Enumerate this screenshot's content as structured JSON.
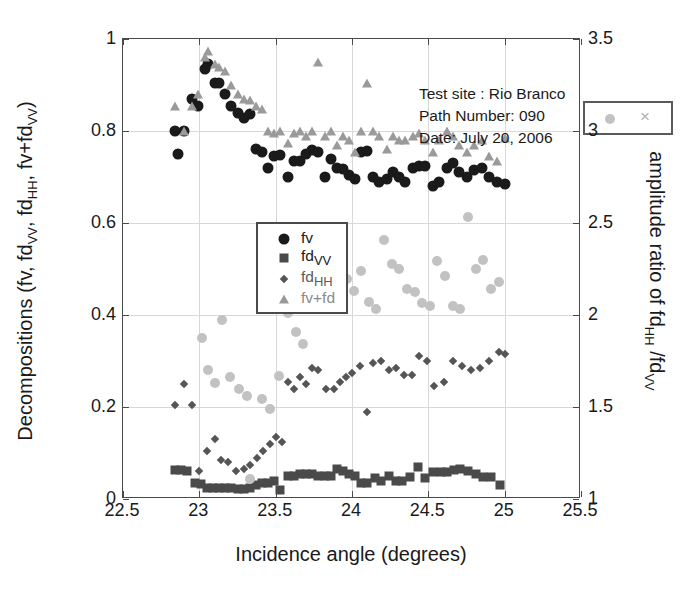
{
  "chart_data": {
    "type": "scatter",
    "title": "",
    "xlabel": "Incidence angle (degrees)",
    "ylabel": "Decompositions (fv, fd_VV, fd_HH, fv+fd_VV)",
    "ylabel_right": "amplitude ratio of fd_HH /fd_VV",
    "xlim": [
      22.5,
      25.5
    ],
    "ylim": [
      0,
      1
    ],
    "ylim_right": [
      1,
      3.5
    ],
    "xticks": [
      "22.5",
      "23",
      "23.5",
      "24",
      "24.5",
      "25",
      "25.5"
    ],
    "xtick_values": [
      22.5,
      23,
      23.5,
      24,
      24.5,
      25,
      25.5
    ],
    "yticks_left": [
      "0",
      "0.2",
      "0.4",
      "0.6",
      "0.8",
      "1"
    ],
    "ytick_values_left": [
      0,
      0.2,
      0.4,
      0.6,
      0.8,
      1
    ],
    "yticks_right": [
      "1",
      "1.5",
      "2",
      "2.5",
      "3",
      "3.5"
    ],
    "ytick_values_right": [
      1,
      1.5,
      2,
      2.5,
      3,
      3.5
    ],
    "grid": true,
    "legend_position": "center-left",
    "annotation": {
      "test_site": "Test site : Rio Branco",
      "path_number": "Path Number: 090",
      "date": "Date: July 20, 2006"
    },
    "legend_entries": [
      {
        "label": "fv",
        "marker": "circle",
        "color": "#1a1a1a",
        "axis": "left"
      },
      {
        "label": "fd_VV",
        "marker": "square",
        "color": "#4a4a4a",
        "axis": "left"
      },
      {
        "label": "fd_HH",
        "marker": "diamond",
        "color": "#555555",
        "axis": "left"
      },
      {
        "label": "fv+fd",
        "marker": "triangle",
        "color": "#9a9a9a",
        "axis": "left"
      }
    ],
    "legend_ratio": [
      {
        "label": "",
        "marker": "circle",
        "color": "#c2c2c2",
        "axis": "right"
      },
      {
        "label": "",
        "marker": "x",
        "color": "#b0b0b0",
        "axis": "right"
      }
    ],
    "series": [
      {
        "name": "fv",
        "marker": "circle",
        "color": "#1a1a1a",
        "axis": "left",
        "points": [
          [
            22.84,
            0.8
          ],
          [
            22.86,
            0.75
          ],
          [
            22.9,
            0.8
          ],
          [
            22.95,
            0.87
          ],
          [
            22.99,
            0.855
          ],
          [
            23.04,
            0.935
          ],
          [
            23.06,
            0.945
          ],
          [
            23.1,
            0.905
          ],
          [
            23.13,
            0.905
          ],
          [
            23.17,
            0.88
          ],
          [
            23.21,
            0.855
          ],
          [
            23.25,
            0.84
          ],
          [
            23.29,
            0.828
          ],
          [
            23.33,
            0.838
          ],
          [
            23.37,
            0.76
          ],
          [
            23.41,
            0.755
          ],
          [
            23.45,
            0.72
          ],
          [
            23.49,
            0.745
          ],
          [
            23.53,
            0.748
          ],
          [
            23.58,
            0.7
          ],
          [
            23.62,
            0.735
          ],
          [
            23.66,
            0.735
          ],
          [
            23.7,
            0.75
          ],
          [
            23.74,
            0.758
          ],
          [
            23.78,
            0.755
          ],
          [
            23.82,
            0.7
          ],
          [
            23.86,
            0.74
          ],
          [
            23.9,
            0.72
          ],
          [
            23.94,
            0.718
          ],
          [
            23.98,
            0.705
          ],
          [
            24.02,
            0.695
          ],
          [
            24.06,
            0.755
          ],
          [
            24.1,
            0.757
          ],
          [
            24.14,
            0.7
          ],
          [
            24.18,
            0.69
          ],
          [
            24.23,
            0.695
          ],
          [
            24.27,
            0.71
          ],
          [
            24.31,
            0.7
          ],
          [
            24.35,
            0.69
          ],
          [
            24.4,
            0.72
          ],
          [
            24.44,
            0.725
          ],
          [
            24.48,
            0.725
          ],
          [
            24.53,
            0.68
          ],
          [
            24.57,
            0.69
          ],
          [
            24.62,
            0.72
          ],
          [
            24.66,
            0.73
          ],
          [
            24.7,
            0.71
          ],
          [
            24.75,
            0.7
          ],
          [
            24.8,
            0.715
          ],
          [
            24.85,
            0.72
          ],
          [
            24.9,
            0.7
          ],
          [
            24.95,
            0.69
          ],
          [
            25.0,
            0.685
          ]
        ]
      },
      {
        "name": "fv+fd",
        "marker": "triangle",
        "color": "#9a9a9a",
        "axis": "left",
        "points": [
          [
            22.84,
            0.855
          ],
          [
            22.9,
            0.8
          ],
          [
            22.95,
            0.855
          ],
          [
            22.99,
            0.88
          ],
          [
            23.04,
            0.96
          ],
          [
            23.06,
            0.975
          ],
          [
            23.1,
            0.945
          ],
          [
            23.13,
            0.94
          ],
          [
            23.17,
            0.93
          ],
          [
            23.21,
            0.9
          ],
          [
            23.25,
            0.88
          ],
          [
            23.29,
            0.87
          ],
          [
            23.33,
            0.868
          ],
          [
            23.37,
            0.855
          ],
          [
            23.41,
            0.848
          ],
          [
            23.45,
            0.8
          ],
          [
            23.49,
            0.795
          ],
          [
            23.53,
            0.8
          ],
          [
            23.58,
            0.775
          ],
          [
            23.62,
            0.795
          ],
          [
            23.66,
            0.8
          ],
          [
            23.7,
            0.79
          ],
          [
            23.74,
            0.8
          ],
          [
            23.78,
            0.95
          ],
          [
            23.82,
            0.79
          ],
          [
            23.86,
            0.8
          ],
          [
            23.9,
            0.77
          ],
          [
            23.94,
            0.79
          ],
          [
            23.98,
            0.78
          ],
          [
            24.02,
            0.755
          ],
          [
            24.06,
            0.8
          ],
          [
            24.1,
            0.905
          ],
          [
            24.14,
            0.8
          ],
          [
            24.18,
            0.79
          ],
          [
            24.23,
            0.76
          ],
          [
            24.27,
            0.79
          ],
          [
            24.31,
            0.78
          ],
          [
            24.35,
            0.78
          ],
          [
            24.4,
            0.79
          ],
          [
            24.44,
            0.795
          ],
          [
            24.48,
            0.78
          ],
          [
            24.53,
            0.755
          ],
          [
            24.57,
            0.78
          ],
          [
            24.62,
            0.8
          ],
          [
            24.66,
            0.79
          ],
          [
            24.7,
            0.77
          ],
          [
            24.75,
            0.755
          ],
          [
            24.8,
            0.77
          ],
          [
            24.85,
            0.78
          ],
          [
            24.9,
            0.745
          ],
          [
            24.95,
            0.735
          ],
          [
            25.0,
            0.785
          ]
        ]
      },
      {
        "name": "fd_HH",
        "marker": "diamond",
        "color": "#555555",
        "axis": "left",
        "points": [
          [
            22.84,
            0.205
          ],
          [
            22.9,
            0.25
          ],
          [
            22.95,
            0.205
          ],
          [
            23.0,
            0.06
          ],
          [
            23.05,
            0.105
          ],
          [
            23.1,
            0.13
          ],
          [
            23.14,
            0.085
          ],
          [
            23.19,
            0.08
          ],
          [
            23.24,
            0.06
          ],
          [
            23.29,
            0.065
          ],
          [
            23.33,
            0.075
          ],
          [
            23.38,
            0.09
          ],
          [
            23.42,
            0.105
          ],
          [
            23.46,
            0.12
          ],
          [
            23.5,
            0.135
          ],
          [
            23.54,
            0.125
          ],
          [
            23.58,
            0.255
          ],
          [
            23.62,
            0.24
          ],
          [
            23.66,
            0.265
          ],
          [
            23.7,
            0.25
          ],
          [
            23.74,
            0.285
          ],
          [
            23.78,
            0.28
          ],
          [
            23.83,
            0.24
          ],
          [
            23.88,
            0.24
          ],
          [
            23.92,
            0.255
          ],
          [
            23.96,
            0.265
          ],
          [
            24.0,
            0.275
          ],
          [
            24.05,
            0.29
          ],
          [
            24.1,
            0.19
          ],
          [
            24.14,
            0.295
          ],
          [
            24.19,
            0.3
          ],
          [
            24.24,
            0.28
          ],
          [
            24.29,
            0.285
          ],
          [
            24.34,
            0.27
          ],
          [
            24.39,
            0.27
          ],
          [
            24.44,
            0.31
          ],
          [
            24.49,
            0.3
          ],
          [
            24.54,
            0.245
          ],
          [
            24.6,
            0.255
          ],
          [
            24.66,
            0.3
          ],
          [
            24.72,
            0.29
          ],
          [
            24.78,
            0.28
          ],
          [
            24.84,
            0.285
          ],
          [
            24.9,
            0.3
          ],
          [
            24.96,
            0.32
          ],
          [
            25.0,
            0.315
          ]
        ]
      },
      {
        "name": "fd_VV",
        "marker": "square",
        "color": "#4a4a4a",
        "axis": "left",
        "points": [
          [
            22.84,
            0.062
          ],
          [
            22.88,
            0.062
          ],
          [
            22.92,
            0.06
          ],
          [
            22.97,
            0.035
          ],
          [
            23.01,
            0.032
          ],
          [
            23.05,
            0.025
          ],
          [
            23.09,
            0.025
          ],
          [
            23.13,
            0.025
          ],
          [
            23.17,
            0.025
          ],
          [
            23.21,
            0.025
          ],
          [
            23.25,
            0.022
          ],
          [
            23.29,
            0.022
          ],
          [
            23.33,
            0.025
          ],
          [
            23.37,
            0.03
          ],
          [
            23.41,
            0.035
          ],
          [
            23.45,
            0.035
          ],
          [
            23.49,
            0.04
          ],
          [
            23.53,
            0.02
          ],
          [
            23.58,
            0.05
          ],
          [
            23.62,
            0.05
          ],
          [
            23.66,
            0.055
          ],
          [
            23.7,
            0.055
          ],
          [
            23.74,
            0.055
          ],
          [
            23.78,
            0.05
          ],
          [
            23.82,
            0.05
          ],
          [
            23.86,
            0.05
          ],
          [
            23.9,
            0.065
          ],
          [
            23.94,
            0.06
          ],
          [
            23.98,
            0.055
          ],
          [
            24.02,
            0.05
          ],
          [
            24.06,
            0.035
          ],
          [
            24.1,
            0.035
          ],
          [
            24.15,
            0.045
          ],
          [
            24.19,
            0.04
          ],
          [
            24.24,
            0.05
          ],
          [
            24.29,
            0.04
          ],
          [
            24.33,
            0.04
          ],
          [
            24.38,
            0.048
          ],
          [
            24.43,
            0.07
          ],
          [
            24.48,
            0.045
          ],
          [
            24.53,
            0.058
          ],
          [
            24.58,
            0.058
          ],
          [
            24.62,
            0.058
          ],
          [
            24.67,
            0.062
          ],
          [
            24.71,
            0.065
          ],
          [
            24.76,
            0.06
          ],
          [
            24.81,
            0.055
          ],
          [
            24.86,
            0.048
          ],
          [
            24.91,
            0.048
          ],
          [
            24.97,
            0.03
          ]
        ]
      },
      {
        "name": "amplitude ratio",
        "marker": "circle-light",
        "color": "#c2c2c2",
        "axis": "right",
        "points": [
          [
            23.02,
            1.875
          ],
          [
            23.06,
            1.7
          ],
          [
            23.1,
            1.63
          ],
          [
            23.15,
            1.975
          ],
          [
            23.2,
            1.665
          ],
          [
            23.26,
            1.6
          ],
          [
            23.31,
            1.56
          ],
          [
            23.33,
            1.11
          ],
          [
            23.41,
            1.545
          ],
          [
            23.46,
            1.49
          ],
          [
            23.52,
            1.67
          ],
          [
            23.58,
            2.01
          ],
          [
            23.63,
            1.905
          ],
          [
            23.68,
            1.845
          ],
          [
            23.73,
            2.2
          ],
          [
            23.78,
            2.215
          ],
          [
            23.83,
            2.06
          ],
          [
            23.88,
            2.295
          ],
          [
            23.93,
            2.17
          ],
          [
            23.97,
            2.195
          ],
          [
            24.01,
            2.13
          ],
          [
            24.06,
            2.24
          ],
          [
            24.11,
            2.07
          ],
          [
            24.16,
            2.03
          ],
          [
            24.21,
            2.41
          ],
          [
            24.26,
            2.275
          ],
          [
            24.31,
            2.25
          ],
          [
            24.36,
            2.14
          ],
          [
            24.41,
            2.125
          ],
          [
            24.46,
            2.065
          ],
          [
            24.51,
            2.05
          ],
          [
            24.56,
            2.295
          ],
          [
            24.61,
            2.21
          ],
          [
            24.66,
            2.05
          ],
          [
            24.71,
            2.03
          ],
          [
            24.76,
            2.53
          ],
          [
            24.81,
            2.25
          ],
          [
            24.86,
            2.3
          ],
          [
            24.91,
            2.14
          ],
          [
            24.96,
            2.18
          ]
        ]
      }
    ]
  }
}
